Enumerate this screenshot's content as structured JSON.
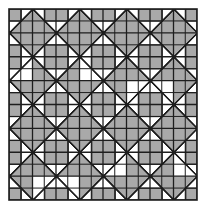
{
  "figure": {
    "canvas": {
      "width": 205,
      "height": 212
    },
    "frame": {
      "x": 9,
      "y": 9,
      "width": 188,
      "height": 191
    },
    "colors": {
      "fill": "#a9a9a9",
      "background": "#ffffff",
      "line": "#1e1e1e"
    },
    "lattice": {
      "diamond_half_diagonal": 24,
      "origin": [
        33,
        33
      ],
      "step": 24,
      "columns_range": [
        -1,
        8
      ],
      "rows_range": [
        -1,
        8
      ]
    },
    "diamond_types": {
      "solid": "gray diamond split into four quadrants (a and b both even)",
      "square_in_diamond": "white diamond with gray center square split into four (a and b both odd)"
    },
    "center_square_half": 12
  }
}
